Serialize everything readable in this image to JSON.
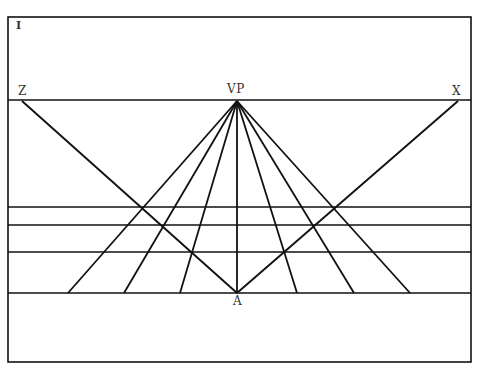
{
  "figure": {
    "number": "I",
    "labels": {
      "left": "Z",
      "vanishing_point": "VP",
      "right": "X",
      "bottom": "A"
    },
    "frame": {
      "x1": 8,
      "y1": 17,
      "x2": 471,
      "y2": 362
    },
    "horizon_y": 100,
    "vanishing_point": {
      "x": 237,
      "y": 101
    },
    "ground_line_y": 293,
    "horizontal_lines_y": [
      207,
      225,
      252
    ],
    "converging_endpoints_x": [
      68,
      124,
      180,
      237,
      297,
      354,
      410
    ],
    "diagonals": [
      {
        "from": "Z",
        "x1": 22,
        "y1": 101,
        "x2": 237,
        "y2": 293
      },
      {
        "from": "X",
        "x1": 458,
        "y1": 101,
        "x2": 237,
        "y2": 293
      }
    ]
  }
}
